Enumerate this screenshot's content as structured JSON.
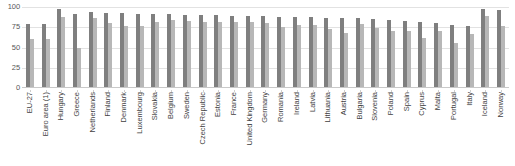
{
  "chart_data": {
    "type": "bar",
    "title": "",
    "subtitle": "",
    "xlabel": "",
    "ylabel": "",
    "ylim": [
      0,
      100
    ],
    "yticks": [
      0,
      25,
      50,
      75,
      100
    ],
    "ytick_labels": [
      "0",
      "25",
      "50",
      "75",
      "100"
    ],
    "grid": true,
    "legend": "none",
    "orientation": "vertical",
    "grouping": "grouped",
    "categories": [
      "EU-27",
      "Euro area (1)",
      "Hungary",
      "Greece",
      "Netherlands",
      "Finland",
      "Denmark",
      "Luxembourg",
      "Slovakia",
      "Belgium",
      "Sweden",
      "Czech Republic",
      "Estonia",
      "France",
      "United Kingdom",
      "Germany",
      "Romania",
      "Ireland",
      "Latvia",
      "Lithuania",
      "Austria",
      "Bulgaria",
      "Slovenia",
      "Poland",
      "Spain",
      "Cyprus",
      "Malta",
      "Portugal",
      "Italy",
      "Iceland",
      "Norway"
    ],
    "series": [
      {
        "name": "Series 1",
        "color": "#7f7f7f",
        "values": [
          79,
          79,
          97,
          91,
          94,
          93,
          93,
          91,
          91,
          91,
          90,
          90,
          90,
          89,
          89,
          89,
          88,
          88,
          88,
          87,
          87,
          86,
          85,
          84,
          83,
          82,
          80,
          78,
          77,
          97,
          96
        ]
      },
      {
        "name": "Series 2",
        "color": "#b7b7b7",
        "values": [
          61,
          60,
          88,
          49,
          86,
          80,
          76,
          76,
          82,
          84,
          83,
          81,
          82,
          82,
          82,
          80,
          75,
          78,
          78,
          73,
          68,
          79,
          74,
          71,
          70,
          62,
          71,
          55,
          67,
          89,
          76
        ]
      }
    ]
  }
}
